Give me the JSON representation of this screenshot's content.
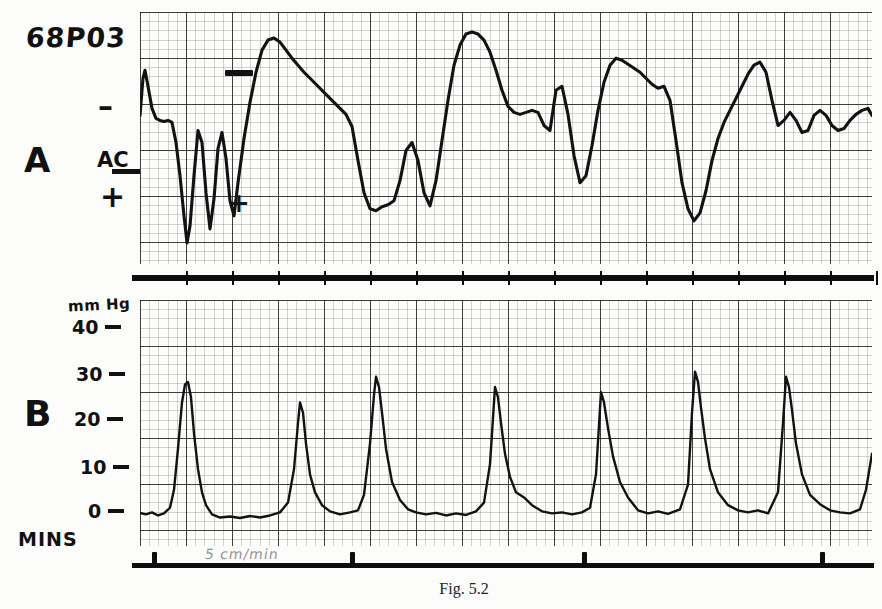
{
  "record": {
    "id": "68P03",
    "caption": "Fig. 5.2"
  },
  "panel_a": {
    "label": "A",
    "baseline_label": "AC",
    "polarity_top": "–",
    "polarity_bottom": "+",
    "calibration_marker": "calibration-bar",
    "marker_plus": "+"
  },
  "panel_b": {
    "label": "B",
    "units": "mm Hg",
    "y_ticks": [
      "40",
      "30",
      "20",
      "10",
      "0"
    ]
  },
  "time_axis": {
    "label": "MINS",
    "speed_note": "5 cm/min",
    "tick_count": 4
  },
  "chart_data": [
    {
      "type": "line",
      "name": "panel-a-electrical-activity",
      "title": "A",
      "ylabel": "AC",
      "xlabel": "MINS",
      "grid": true,
      "legend": "none",
      "axis_note": "minus above AC baseline, plus below AC baseline; arbitrary units",
      "ylim": [
        -1.35,
        1.0
      ],
      "xlim": [
        0,
        732
      ],
      "annotations": [
        {
          "text": "–",
          "x": 98,
          "y": 100
        },
        {
          "text": "AC",
          "x": 97,
          "y": 155
        },
        {
          "text": "+",
          "x": 100,
          "y": 198
        },
        {
          "text": "calibration bar",
          "x": 225,
          "y": 73
        },
        {
          "text": "+",
          "x": 230,
          "y": 200
        }
      ],
      "x": [
        0,
        3,
        5,
        8,
        12,
        16,
        20,
        24,
        28,
        32,
        36,
        40,
        44,
        47,
        50,
        54,
        58,
        62,
        66,
        70,
        74,
        78,
        82,
        86,
        90,
        94,
        98,
        104,
        110,
        116,
        122,
        128,
        134,
        140,
        146,
        152,
        158,
        164,
        170,
        176,
        182,
        188,
        194,
        200,
        206,
        212,
        218,
        224,
        230,
        236,
        242,
        248,
        254,
        260,
        266,
        272,
        278,
        284,
        290,
        296,
        302,
        308,
        314,
        320,
        326,
        332,
        338,
        344,
        350,
        356,
        362,
        368,
        374,
        380,
        386,
        392,
        398,
        404,
        410,
        416,
        422,
        428,
        434,
        440,
        446,
        452,
        458,
        464,
        470,
        476,
        482,
        488,
        494,
        500,
        506,
        512,
        518,
        524,
        530,
        536,
        542,
        548,
        554,
        560,
        566,
        572,
        578,
        584,
        590,
        596,
        602,
        608,
        614,
        620,
        626,
        632,
        638,
        644,
        650,
        656,
        662,
        668,
        674,
        680,
        686,
        692,
        698,
        704,
        710,
        716,
        722,
        728,
        732
      ],
      "y": [
        0.05,
        0.42,
        0.5,
        0.34,
        0.12,
        0.02,
        0.0,
        -0.01,
        0.0,
        -0.02,
        -0.22,
        -0.55,
        -0.95,
        -1.22,
        -1.05,
        -0.55,
        -0.1,
        -0.22,
        -0.72,
        -1.08,
        -0.78,
        -0.28,
        -0.12,
        -0.38,
        -0.8,
        -0.95,
        -0.62,
        -0.18,
        0.18,
        0.48,
        0.7,
        0.8,
        0.82,
        0.78,
        0.7,
        0.62,
        0.55,
        0.48,
        0.42,
        0.36,
        0.3,
        0.24,
        0.18,
        0.12,
        0.06,
        -0.06,
        -0.4,
        -0.72,
        -0.88,
        -0.9,
        -0.86,
        -0.84,
        -0.8,
        -0.6,
        -0.3,
        -0.22,
        -0.4,
        -0.72,
        -0.85,
        -0.6,
        -0.2,
        0.2,
        0.55,
        0.75,
        0.86,
        0.88,
        0.86,
        0.8,
        0.68,
        0.5,
        0.3,
        0.14,
        0.08,
        0.06,
        0.08,
        0.1,
        0.08,
        -0.05,
        -0.1,
        0.3,
        0.34,
        0.06,
        -0.35,
        -0.62,
        -0.55,
        -0.25,
        0.1,
        0.38,
        0.55,
        0.62,
        0.6,
        0.56,
        0.52,
        0.48,
        0.42,
        0.36,
        0.32,
        0.34,
        0.2,
        -0.2,
        -0.62,
        -0.88,
        -1.0,
        -0.92,
        -0.7,
        -0.4,
        -0.18,
        -0.02,
        0.1,
        0.22,
        0.34,
        0.46,
        0.55,
        0.58,
        0.48,
        0.2,
        -0.05,
        0.0,
        0.08,
        0.0,
        -0.12,
        -0.1,
        0.05,
        0.1,
        0.05,
        -0.05,
        -0.1,
        -0.08,
        0.0,
        0.06,
        0.1,
        0.12,
        0.05
      ]
    },
    {
      "type": "line",
      "name": "panel-b-pressure",
      "title": "B",
      "ylabel": "mm Hg",
      "xlabel": "MINS",
      "grid": true,
      "legend": "none",
      "ylim": [
        0,
        44
      ],
      "yticks": [
        0,
        10,
        20,
        30,
        40
      ],
      "xlim": [
        0,
        732
      ],
      "baseline_mmHg": 4,
      "peaks": [
        {
          "x": 48,
          "amplitude_mmHg": 30
        },
        {
          "x": 160,
          "amplitude_mmHg": 26
        },
        {
          "x": 236,
          "amplitude_mmHg": 31
        },
        {
          "x": 355,
          "amplitude_mmHg": 29
        },
        {
          "x": 461,
          "amplitude_mmHg": 28
        },
        {
          "x": 555,
          "amplitude_mmHg": 32
        },
        {
          "x": 646,
          "amplitude_mmHg": 31
        }
      ],
      "x": [
        0,
        6,
        12,
        18,
        24,
        30,
        34,
        38,
        42,
        45,
        48,
        51,
        54,
        58,
        62,
        66,
        72,
        80,
        90,
        100,
        110,
        120,
        130,
        140,
        148,
        154,
        158,
        160,
        163,
        166,
        170,
        175,
        182,
        190,
        200,
        210,
        218,
        224,
        230,
        234,
        236,
        239,
        242,
        246,
        252,
        260,
        268,
        276,
        286,
        296,
        306,
        316,
        326,
        336,
        344,
        350,
        355,
        358,
        361,
        365,
        370,
        376,
        384,
        392,
        402,
        412,
        422,
        432,
        442,
        450,
        456,
        461,
        464,
        468,
        473,
        480,
        488,
        498,
        508,
        518,
        528,
        540,
        548,
        552,
        555,
        558,
        561,
        565,
        570,
        578,
        588,
        598,
        608,
        618,
        628,
        638,
        643,
        646,
        649,
        652,
        656,
        662,
        670,
        680,
        690,
        700,
        710,
        720,
        726,
        732
      ],
      "y": [
        4.5,
        4.2,
        4.6,
        4.0,
        4.4,
        5.5,
        9.0,
        17.0,
        26.0,
        29.5,
        30.0,
        27.0,
        20.0,
        13.0,
        8.5,
        6.0,
        4.2,
        3.6,
        3.8,
        3.5,
        3.9,
        3.6,
        4.0,
        4.6,
        6.5,
        13.0,
        22.0,
        26.0,
        24.0,
        18.0,
        12.0,
        8.5,
        6.0,
        4.8,
        4.2,
        4.6,
        5.0,
        8.0,
        18.0,
        27.5,
        31.0,
        29.0,
        24.0,
        17.0,
        10.5,
        7.0,
        5.2,
        4.6,
        4.2,
        4.5,
        4.0,
        4.4,
        4.1,
        4.8,
        6.5,
        14.0,
        29.0,
        27.0,
        22.0,
        16.0,
        11.5,
        8.5,
        7.5,
        6.0,
        4.8,
        4.4,
        4.6,
        4.2,
        4.6,
        5.5,
        12.0,
        28.0,
        26.0,
        21.0,
        15.5,
        10.5,
        7.5,
        5.0,
        4.4,
        4.8,
        4.3,
        5.2,
        10.0,
        24.0,
        32.0,
        30.0,
        25.0,
        19.0,
        13.0,
        8.5,
        6.0,
        5.0,
        4.6,
        5.0,
        4.4,
        8.5,
        22.0,
        31.0,
        29.0,
        24.5,
        18.0,
        12.0,
        8.0,
        6.2,
        5.0,
        4.6,
        4.4,
        5.2,
        9.0,
        16.0
      ]
    }
  ]
}
